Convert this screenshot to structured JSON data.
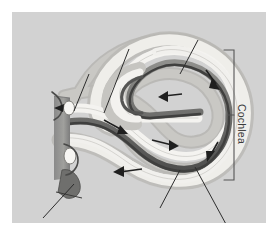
{
  "figure": {
    "kind": "anatomical-diagram",
    "panel": {
      "background_color": "#d2d2d2",
      "outer_margin_color": "#ffffff",
      "x": 12,
      "y": 12,
      "width": 254,
      "height": 211
    },
    "labels": [
      {
        "id": "cochlea",
        "text": "Cochlea",
        "orientation": "rotated-90-clockwise",
        "color": "#3a3a3a",
        "x": 236,
        "y": 92
      }
    ],
    "bracket": {
      "id": "cochlea-bracket",
      "color": "#555555",
      "x": 222,
      "top": 38,
      "bottom": 168,
      "arm_length": 10,
      "tick_y": 103
    },
    "leader_lines": [
      {
        "id": "leader-upper-right",
        "x1": 186,
        "y1": 28,
        "x2": 168,
        "y2": 62
      },
      {
        "id": "leader-upper-mid",
        "x1": 117,
        "y1": 37,
        "x2": 92,
        "y2": 101
      },
      {
        "id": "leader-upper-left",
        "x1": 77,
        "y1": 62,
        "x2": 62,
        "y2": 99
      },
      {
        "id": "leader-lower-left",
        "x1": 31,
        "y1": 206,
        "x2": 62,
        "y2": 172
      },
      {
        "id": "leader-lower-mid",
        "x1": 148,
        "y1": 196,
        "x2": 168,
        "y2": 158
      },
      {
        "id": "leader-lower-right",
        "x1": 215,
        "y1": 214,
        "x2": 183,
        "y2": 155
      }
    ],
    "flow_arrows": [
      {
        "id": "arrow-oval-window-in",
        "direction": "right",
        "x": 57,
        "y": 105
      },
      {
        "id": "arrow-vestibuli-1",
        "direction": "right-down",
        "x": 110,
        "y": 120
      },
      {
        "id": "arrow-vestibuli-2",
        "direction": "right",
        "x": 160,
        "y": 134
      },
      {
        "id": "arrow-apex-turn",
        "direction": "down-right",
        "x": 203,
        "y": 75
      },
      {
        "id": "arrow-upper-return",
        "direction": "left",
        "x": 152,
        "y": 85
      },
      {
        "id": "arrow-outer-down",
        "direction": "down-left",
        "x": 199,
        "y": 141
      },
      {
        "id": "arrow-tympani-back",
        "direction": "left",
        "x": 108,
        "y": 160
      }
    ],
    "structures": [
      {
        "id": "scala-vestibuli",
        "fill": "#f2f1ee",
        "note": "upper light fluid channel"
      },
      {
        "id": "scala-media",
        "fill": "#6e6e6e",
        "note": "dark band between channels"
      },
      {
        "id": "scala-tympani",
        "fill": "#f2f1ee",
        "note": "lower light fluid channel"
      },
      {
        "id": "cochlear-wall",
        "fill": "#c2c1bd",
        "note": "outer bony capsule shading"
      },
      {
        "id": "oval-window",
        "fill": "#f6f5f2",
        "note": "upper membrane window"
      },
      {
        "id": "round-window",
        "fill": "#f6f5f2",
        "note": "lower membrane window"
      },
      {
        "id": "middle-ear-wall",
        "fill": "#8d8d8d",
        "note": "vertical shaded column at left"
      },
      {
        "id": "basal-stub",
        "fill": "#6b6b6b",
        "note": "dark wedge at lower left"
      }
    ]
  }
}
